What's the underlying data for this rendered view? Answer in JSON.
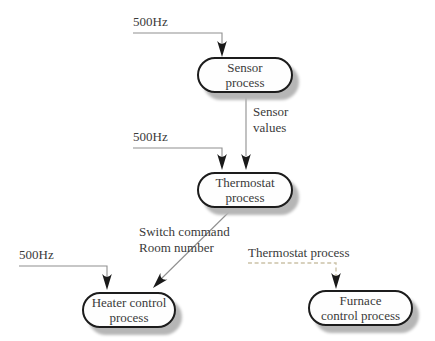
{
  "figure": {
    "nodes": {
      "sensor": {
        "line1": "Sensor",
        "line2": "process"
      },
      "thermostat": {
        "line1": "Thermostat",
        "line2": "process"
      },
      "heater": {
        "line1": "Heater control",
        "line2": "process"
      },
      "furnace": {
        "line1": "Furnace",
        "line2": "control process"
      }
    },
    "labels": {
      "clock_sensor": "500Hz",
      "clock_thermostat": "500Hz",
      "clock_heater": "500Hz",
      "sensor_values": {
        "line1": "Sensor",
        "line2": "values"
      },
      "switch_command": {
        "line1": "Switch command",
        "line2": "Room number"
      },
      "thermostat_process_ref": "Thermostat process"
    }
  },
  "theme": {
    "bg": "#ffffff",
    "node-fill": "#fefefe",
    "node-border": "#1c1c1c",
    "node-shadow": "#b6b6b6",
    "text": "#3a3a3a",
    "line": "#8f8f8f",
    "arrow": "#1a1a1a",
    "dashed-line": "#cbc2a8"
  }
}
